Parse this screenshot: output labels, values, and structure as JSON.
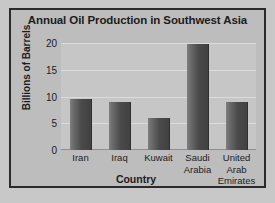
{
  "chart_data": {
    "type": "bar",
    "title": "Annual Oil Production in Southwest Asia",
    "xlabel": "Country",
    "ylabel": "Billions of Barrels",
    "categories": [
      "Iran",
      "Iraq",
      "Kuwait",
      "Saudi Arabia",
      "United Arab Emirates"
    ],
    "category_lines": [
      [
        "Iran"
      ],
      [
        "Iraq"
      ],
      [
        "Kuwait"
      ],
      [
        "Saudi",
        "Arabia"
      ],
      [
        "United",
        "Arab",
        "Emirates"
      ]
    ],
    "values": [
      9.5,
      9,
      6,
      19.8,
      9
    ],
    "ylim": [
      0,
      20
    ],
    "yticks": [
      0,
      5,
      10,
      15,
      20
    ],
    "ytick_labels": [
      "0",
      "5",
      "10",
      "15",
      "20"
    ],
    "grid": true,
    "legend": null,
    "colors": {
      "bar_light": "#7e7e7e",
      "bar_dark": "#414141",
      "plot_background": "#c6c6c6",
      "panel_background": "#bdbdbd",
      "page_background": "#c8c8c8",
      "frame_border": "#2b2b2b",
      "gridline": "#dcdcdc",
      "text": "#1c1c1c"
    }
  }
}
